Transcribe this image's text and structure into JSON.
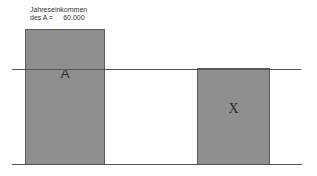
{
  "annotation": {
    "line1": "Jahreseinkommen",
    "line2_prefix": "des A =",
    "line2_value": "60.000"
  },
  "boxes": [
    {
      "id": "A",
      "label": "A",
      "color": "#8f8f8f"
    },
    {
      "id": "X",
      "label": "X",
      "color": "#8f8f8f"
    }
  ],
  "lines": [
    {
      "id": "reference-line",
      "color": "#555555"
    },
    {
      "id": "baseline",
      "color": "#555555"
    }
  ]
}
